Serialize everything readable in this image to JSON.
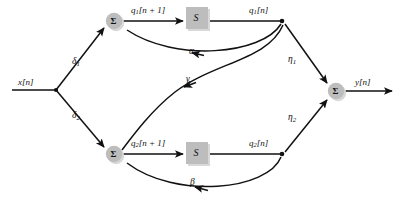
{
  "diagram": {
    "type": "signal-flow-graph",
    "colors": {
      "node_fill": "#bdbdbd",
      "block_fill": "#bdbdbd",
      "line": "#111111",
      "background": "#ffffff"
    },
    "signals": {
      "input": "x[n]",
      "output": "y[n]",
      "state1_next": "q1[n + 1]",
      "state1": "q1[n]",
      "state2_next": "q2[n + 1]",
      "state2": "q2[n]"
    },
    "coefficients": {
      "delta1": "δ",
      "delta1_sub": "1",
      "delta2": "δ",
      "delta2_sub": "2",
      "alpha": "α",
      "beta": "β",
      "gamma": "γ",
      "eta1": "η",
      "eta1_sub": "1",
      "eta2": "η",
      "eta2_sub": "2"
    },
    "nodes": {
      "sum_top": "Σ",
      "sum_bottom": "Σ",
      "sum_output": "Σ",
      "delay_block_1": "S",
      "delay_block_2": "S"
    },
    "signal_parts": {
      "q1_next_base": "q",
      "q1_next_sub": "1",
      "q1_next_index": "[n + 1]",
      "q1_base": "q",
      "q1_sub": "1",
      "q1_index": "[n]",
      "q2_next_base": "q",
      "q2_next_sub": "2",
      "q2_next_index": "[n + 1]",
      "q2_base": "q",
      "q2_sub": "2",
      "q2_index": "[n]",
      "x_base": "x",
      "x_index": "[n]",
      "y_base": "y",
      "y_index": "[n]"
    }
  }
}
